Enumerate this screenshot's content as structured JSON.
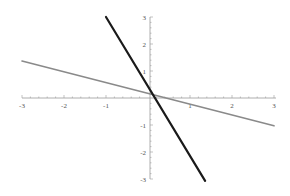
{
  "chart_data": {
    "type": "line",
    "title": "",
    "xlabel": "",
    "ylabel": "",
    "xlim": [
      -3,
      3
    ],
    "ylim": [
      -3,
      3
    ],
    "grid": false,
    "legend": "none",
    "axes_style": "centered at origin with minor ticks",
    "x_ticks": [
      -3,
      -2,
      -1,
      1,
      2,
      3
    ],
    "x_tick_labels": [
      "-3",
      "-2",
      "-1",
      "1",
      "2",
      "3"
    ],
    "y_ticks": [
      -3,
      -2,
      -1,
      1,
      2,
      3
    ],
    "y_tick_labels": [
      "-3",
      "-2",
      "-1",
      "1",
      "2",
      "3"
    ],
    "minor_ticks_per_unit": 5,
    "series": [
      {
        "name": "gray line",
        "color": "#8a8a8a",
        "points": [
          [
            -3,
            1.37
          ],
          [
            3,
            -1.03
          ]
        ]
      },
      {
        "name": "black line",
        "color": "#1a1a1a",
        "points": [
          [
            -1.0,
            3.0
          ],
          [
            1.36,
            -3.07
          ]
        ]
      }
    ]
  }
}
